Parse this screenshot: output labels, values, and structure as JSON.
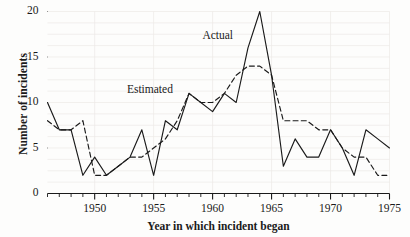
{
  "chart_data": {
    "type": "line",
    "title": "",
    "xlabel": "Year in which incident began",
    "ylabel": "Number of incidents",
    "xlim": [
      1946,
      1975
    ],
    "ylim": [
      0,
      20
    ],
    "grid": false,
    "legend_position": "inline-annotation",
    "xticks": [
      1950,
      1955,
      1960,
      1965,
      1970,
      1975
    ],
    "xtick_labels": [
      "1950",
      "1955",
      "1960",
      "1965",
      "1970",
      "1975"
    ],
    "xminor_step": 1,
    "yticks": [
      0,
      5,
      10,
      15,
      20
    ],
    "ytick_labels": [
      "0",
      "5",
      "10",
      "15",
      "20"
    ],
    "x": [
      1946,
      1947,
      1948,
      1949,
      1950,
      1951,
      1952,
      1953,
      1954,
      1955,
      1956,
      1957,
      1958,
      1959,
      1960,
      1961,
      1962,
      1963,
      1964,
      1965,
      1966,
      1967,
      1968,
      1969,
      1970,
      1971,
      1972,
      1973,
      1974,
      1975
    ],
    "series": [
      {
        "name": "Actual",
        "style": "solid",
        "color": "#1a1a1a",
        "values": [
          10,
          7,
          7,
          2,
          4,
          2,
          3,
          4,
          7,
          2,
          8,
          7,
          11,
          10,
          9,
          11,
          10,
          16,
          20,
          13,
          3,
          6,
          4,
          4,
          7,
          5,
          2,
          7,
          6,
          5
        ]
      },
      {
        "name": "Estimated",
        "style": "dashed",
        "color": "#1a1a1a",
        "values": [
          8,
          7,
          7,
          8,
          2,
          2,
          3,
          4,
          4,
          5,
          6,
          8,
          11,
          10,
          10,
          11,
          13,
          14,
          14,
          13,
          8,
          8,
          8,
          7,
          7,
          5,
          4,
          4,
          2,
          2
        ]
      }
    ],
    "annotations": [
      {
        "text": "Actual",
        "x": 1961.0,
        "y": 17.2
      },
      {
        "text": "Estimated",
        "x": 1954.6,
        "y": 11.3
      }
    ]
  }
}
